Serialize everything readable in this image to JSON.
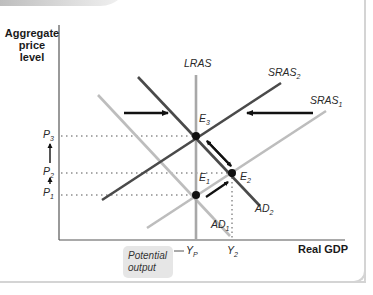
{
  "axes": {
    "y_label_line1": "Aggregate",
    "y_label_line2": "price",
    "y_label_line3": "level",
    "x_label": "Real GDP"
  },
  "curves": {
    "lras": "LRAS",
    "sras2_main": "SRAS",
    "sras2_sub": "2",
    "sras1_main": "SRAS",
    "sras1_sub": "1",
    "ad2_main": "AD",
    "ad2_sub": "2",
    "ad1_main": "AD",
    "ad1_sub": "1"
  },
  "points": {
    "e3_main": "E",
    "e3_sub": "3",
    "e2_main": "E",
    "e2_sub": "2",
    "e1_main": "E",
    "e1_sub": "1"
  },
  "price_levels": {
    "p3_main": "P",
    "p3_sub": "3",
    "p2_main": "P",
    "p2_sub": "2",
    "p1_main": "P",
    "p1_sub": "1"
  },
  "outputs": {
    "yp_main": "Y",
    "yp_sub": "P",
    "y2_main": "Y",
    "y2_sub": "2"
  },
  "callout": {
    "line1": "Potential",
    "line2": "output"
  },
  "colors": {
    "dark_curve": "#4a4a4a",
    "light_curve": "#bdbdbd",
    "lras": "#a8a8a8",
    "arrow": "#111111",
    "axis": "#555555"
  }
}
